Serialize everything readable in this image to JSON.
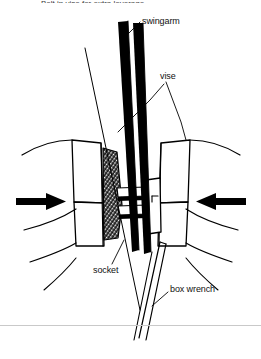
{
  "figure": {
    "caption_top": "Bolt in vise for extra leverage",
    "labels": {
      "swingarm": "swingarm",
      "vise": "vise",
      "socket": "socket",
      "box_wrench": "box wrench"
    },
    "icons": {
      "left_arrow": "arrow-right-icon",
      "right_arrow": "arrow-left-icon"
    },
    "colors": {
      "ink": "#000000",
      "paper": "#ffffff",
      "rule": "#c9c9c9",
      "label_text": "#111111"
    }
  }
}
